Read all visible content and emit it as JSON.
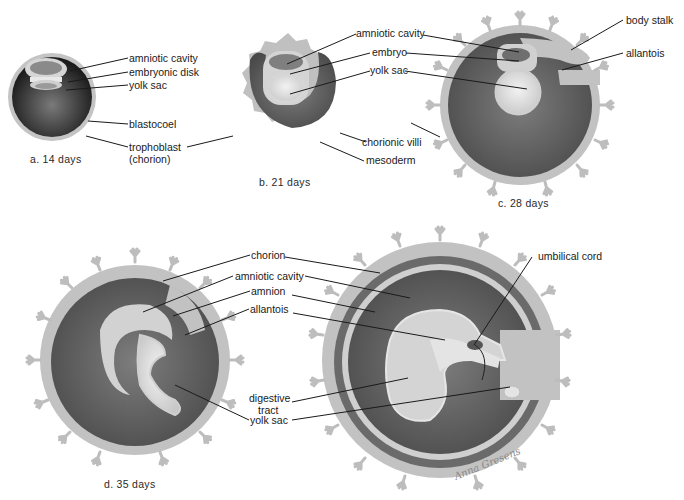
{
  "figure": {
    "colors": {
      "background": "#ffffff",
      "chorion": "#bdbdbd",
      "cavity_dark": "#5e5e5e",
      "blastocoel": "#2a2a2a",
      "membrane_light": "#d9d9d9",
      "yolk_light": "#e6e6e6",
      "leader_line": "#1a1a1a"
    },
    "panels": [
      {
        "id": "a",
        "caption": "a. 14 days",
        "labels": [
          "amniotic cavity",
          "embryonic disk",
          "yolk sac",
          "blastocoel",
          "trophoblast",
          "(chorion)"
        ]
      },
      {
        "id": "b",
        "caption": "b. 21 days",
        "labels": [
          "amniotic cavity",
          "embryo",
          "yolk sac",
          "chorionic villi",
          "mesoderm"
        ]
      },
      {
        "id": "c",
        "caption": "c. 28 days",
        "labels": [
          "body stalk",
          "allantois"
        ]
      },
      {
        "id": "d",
        "caption": "d. 35 days",
        "labels": [
          "chorion",
          "amniotic cavity",
          "amnion",
          "allantois",
          "digestive",
          "tract",
          "yolk sac"
        ]
      },
      {
        "id": "e",
        "caption": "",
        "labels": [
          "umbilical cord"
        ]
      }
    ],
    "signature": "Anna Gresens"
  }
}
